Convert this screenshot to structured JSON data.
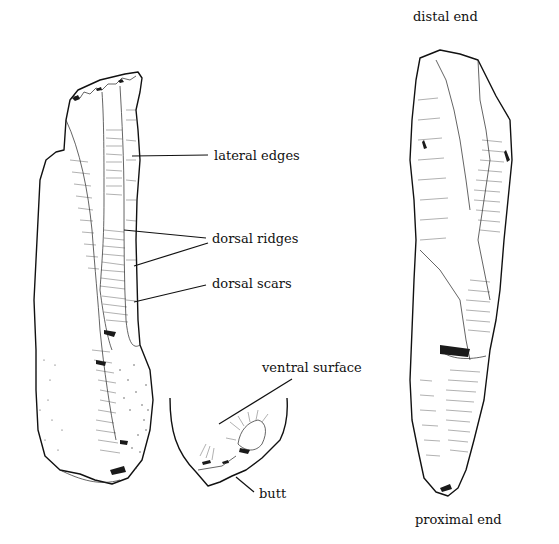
{
  "figure": {
    "labels": {
      "distal_end": "distal end",
      "lateral_edges": "lateral edges",
      "dorsal_ridges": "dorsal ridges",
      "dorsal_scars": "dorsal scars",
      "ventral_surface": "ventral surface",
      "butt": "butt",
      "proximal_end": "proximal end"
    },
    "views": [
      "dorsal view",
      "butt detail",
      "ventral view"
    ]
  }
}
